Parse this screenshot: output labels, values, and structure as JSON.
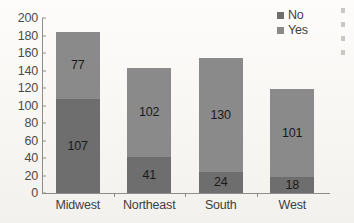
{
  "chart_data": {
    "type": "bar",
    "stacked": true,
    "title": "",
    "xlabel": "",
    "ylabel": "",
    "categories": [
      "Midwest",
      "Northeast",
      "South",
      "West"
    ],
    "series": [
      {
        "name": "No",
        "color": "#6e6e6e",
        "values": [
          107,
          41,
          24,
          18
        ]
      },
      {
        "name": "Yes",
        "color": "#8a8a8a",
        "values": [
          77,
          102,
          130,
          101
        ]
      }
    ],
    "totals": [
      184,
      143,
      154,
      119
    ],
    "ylim": [
      0,
      200
    ],
    "yticks": [
      0,
      20,
      40,
      60,
      80,
      100,
      120,
      140,
      160,
      180,
      200
    ],
    "ytick_labels": [
      "0",
      "20",
      "40",
      "60",
      "80",
      "100",
      "120",
      "140",
      "160",
      "180",
      "200"
    ],
    "grid": false,
    "legend_position": "top-right",
    "legend_entries": [
      "No",
      "Yes"
    ],
    "data_labels": {
      "Midwest": {
        "No": "107",
        "Yes": "77"
      },
      "Northeast": {
        "No": "41",
        "Yes": "102"
      },
      "South": {
        "No": "24",
        "Yes": "130"
      },
      "West": {
        "No": "18",
        "Yes": "101"
      }
    }
  },
  "colors": {
    "series_no": "#6e6e6e",
    "series_yes": "#8a8a8a",
    "axis": "#8d8d8d",
    "text": "#3f3f3f",
    "background": "#fbfaf8"
  }
}
